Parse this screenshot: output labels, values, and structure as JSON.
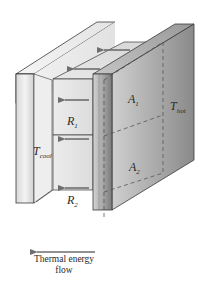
{
  "figure": {
    "labels": {
      "a1": {
        "main": "A",
        "sub": "1"
      },
      "a2": {
        "main": "A",
        "sub": "2"
      },
      "r1": {
        "main": "R",
        "sub": "1"
      },
      "r2": {
        "main": "R",
        "sub": "2"
      },
      "t_hot": {
        "main": "T",
        "sub": "hot"
      },
      "t_cool": {
        "main": "T",
        "sub": "cool"
      }
    },
    "caption": {
      "line1": "Thermal energy",
      "line2": "flow"
    },
    "colors": {
      "arrow": "#6e6e6e",
      "outline": "#3a3a3a",
      "dashed": "#555555",
      "hot_plate_light": "#c9c9c9",
      "hot_plate_dark": "#8f8f8f",
      "cool_plate": "#e6e6e6"
    }
  }
}
